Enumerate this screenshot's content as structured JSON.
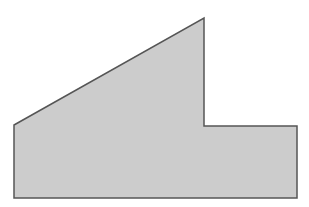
{
  "figure": {
    "type": "polygon",
    "fill": "#cccccc",
    "stroke": "#555555",
    "points": [
      [
        14,
        125
      ],
      [
        204,
        18
      ],
      [
        204,
        126
      ],
      [
        297,
        126
      ],
      [
        297,
        198
      ],
      [
        14,
        198
      ]
    ]
  },
  "caption": {
    "text": ""
  }
}
